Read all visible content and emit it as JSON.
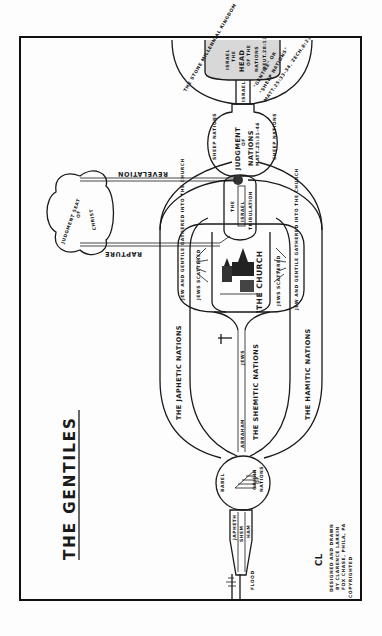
{
  "diagram": {
    "title": "THE GENTILES",
    "orientation": "rotated 90deg counter-clockwise (read with page turned)",
    "flood": {
      "label": "FLOOD",
      "sons": [
        "JAPHETH",
        "SHEM",
        "HAM"
      ]
    },
    "origin": {
      "babel_label": "BABEL",
      "label_line1": "ORIGIN",
      "label_line2": "OF",
      "label_line3": "NATIONS"
    },
    "streams": {
      "japhetic": "THE JAPHETIC NATIONS",
      "shemitic": "THE SHEMITIC NATIONS",
      "hamitic": "THE HAMITIC NATIONS",
      "abraham": "ABRAHAM",
      "jews": "JEWS"
    },
    "church": {
      "label": "THE CHURCH",
      "left_gathered": "JEW AND GENTILE GATHERED INTO THE CHURCH",
      "left_scattered": "JEWS SCATTERED",
      "right_gathered": "JEW AND GENTILE GATHERED INTO THE CHURCH",
      "right_scattered": "JEWS SCATTERED"
    },
    "tribulation": {
      "line1": "THE",
      "line2": "ISRAEL",
      "line3": "TRIBULATION"
    },
    "judgment_seat": {
      "line1": "JUDGMENT SEAT",
      "line2": "OF",
      "line3": "CHRIST"
    },
    "connectors": {
      "revelation": "REVELATION",
      "rapture": "RAPTURE"
    },
    "judgment_of_nations": {
      "line1": "JUDGMENT",
      "line2": "OF",
      "line3": "NATIONS",
      "ref": "MATT.25:31-46",
      "left": "SHEEP NATIONS",
      "right": "SHEEP NATIONS"
    },
    "millennium": {
      "outer_left": "THE STONE MILLENNIAL KINGDOM",
      "israel_line1": "ISRAEL",
      "israel_line2": "THE",
      "israel_line3": "HEAD",
      "israel_line4": "OF THE",
      "israel_line5": "NATIONS",
      "israel_ref": "DEUT.28:13",
      "neck": "ISRAEL",
      "outer_right_line1": "\"GENTILE\" OR",
      "outer_right_line2": "\"SHEEP NATIONS\"",
      "outer_right_ref": "MATT.25:33-34. ZECH.8:23."
    },
    "credits": {
      "monogram": "CL",
      "line1": "DESIGNED AND DRAWN",
      "line2": "BY CLARENCE LARKIN",
      "line3": "FOX CHASE, PHILA, PA",
      "line4": "COPYRIGHTED"
    },
    "colors": {
      "ink": "#1a1a1a",
      "paper": "#fdfdfd",
      "stipple": "#d8d8d8"
    }
  }
}
